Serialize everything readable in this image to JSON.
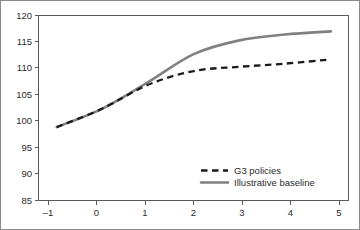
{
  "chart_data": {
    "type": "line",
    "title": "",
    "subtitle": "",
    "xlabel": "",
    "ylabel": "",
    "x": [
      -1,
      0,
      1,
      2,
      3,
      4,
      5
    ],
    "xlim": [
      -1.4,
      5.4
    ],
    "ylim": [
      85,
      120
    ],
    "grid": false,
    "legend_position": "inside-bottom-right",
    "xticks": [
      "–1",
      "0",
      "1",
      "2",
      "3",
      "4",
      "5"
    ],
    "xtick_values": [
      -1,
      0,
      1,
      2,
      3,
      4,
      5
    ],
    "yticks": [
      "85",
      "90",
      "95",
      "100",
      "105",
      "110",
      "115",
      "120"
    ],
    "ytick_values": [
      85,
      90,
      95,
      100,
      105,
      110,
      115,
      120
    ],
    "series": [
      {
        "name": "G3 policies",
        "style": "dashed",
        "color": "#1a1a1a",
        "values": [
          98.8,
          102.3,
          106.8,
          109.4,
          110.2,
          110.8,
          111.6
        ]
      },
      {
        "name": "Illustrative baseline",
        "style": "solid",
        "color": "#808080",
        "values": [
          98.8,
          102.3,
          107.3,
          112.6,
          115.2,
          116.3,
          116.9
        ]
      }
    ]
  },
  "legend": {
    "entries": [
      {
        "label": "G3 policies",
        "color": "#1a1a1a",
        "style": "dashed"
      },
      {
        "label": "Illustrative baseline",
        "color": "#808080",
        "style": "solid"
      }
    ]
  },
  "colors": {
    "axis": "#5a5a5a",
    "text": "#2b2b2b",
    "frame": "#8a8a8a",
    "background": "#ffffff"
  }
}
